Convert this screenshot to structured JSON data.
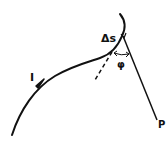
{
  "diagram": {
    "labels": {
      "current": "I",
      "segment": "Δs",
      "angle": "φ",
      "point": "P"
    },
    "colors": {
      "stroke": "#111111",
      "background": "#ffffff"
    }
  }
}
